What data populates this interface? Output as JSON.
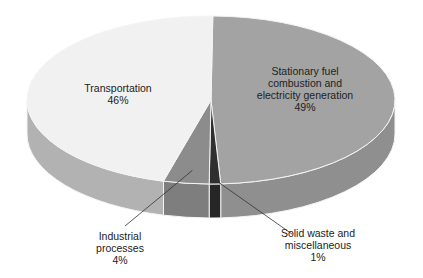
{
  "chart_data": {
    "type": "pie",
    "title": "",
    "style": "3d",
    "slices": [
      {
        "label": "Stationary fuel combustion and electricity generation",
        "value": 49,
        "display": [
          "Stationary fuel",
          "combustion and",
          "electricity generation",
          "49%"
        ],
        "top_color": "#a3a3a3",
        "side_color": "#8f8f8f"
      },
      {
        "label": "Solid waste and miscellaneous",
        "value": 1,
        "display": [
          "Solid waste and",
          "miscellaneous",
          "1%"
        ],
        "top_color": "#2f2f2f",
        "side_color": "#262626"
      },
      {
        "label": "Industrial processes",
        "value": 4,
        "display": [
          "Industrial",
          "processes",
          "4%"
        ],
        "top_color": "#8c8c8c",
        "side_color": "#7e7e7e"
      },
      {
        "label": "Transportation",
        "value": 46,
        "display": [
          "Transportation",
          "46%"
        ],
        "top_color": "#f1f1f1",
        "side_color": "#b2b2b2"
      }
    ]
  }
}
